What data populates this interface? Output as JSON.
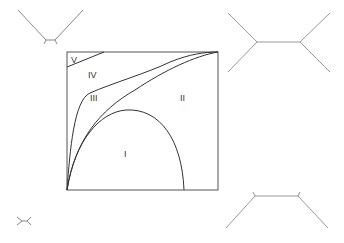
{
  "diagram": {
    "type": "phase-diagram",
    "regions": [
      {
        "id": "I",
        "label": "I"
      },
      {
        "id": "II",
        "label": "II"
      },
      {
        "id": "III",
        "label": "III"
      },
      {
        "id": "IV",
        "label": "IV"
      },
      {
        "id": "V",
        "label": "V"
      }
    ],
    "colors": {
      "line": "#333333",
      "tree": "#999999",
      "background": "#ffffff"
    },
    "trees": [
      {
        "position": "top-left",
        "shape": "nearly-star topology, short internal edge"
      },
      {
        "position": "top-right",
        "shape": "long internal edge, leaves diverging"
      },
      {
        "position": "bottom-left",
        "shape": "tiny tree"
      },
      {
        "position": "bottom-right",
        "shape": "long internal edge, leaves converging downward"
      }
    ]
  }
}
